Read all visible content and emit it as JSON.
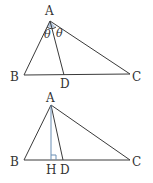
{
  "figure1": {
    "vertices": {
      "A": {
        "label": "A",
        "x": 50,
        "y": 21
      },
      "B": {
        "label": "B",
        "x": 24,
        "y": 75
      },
      "C": {
        "label": "C",
        "x": 130,
        "y": 74
      },
      "D": {
        "label": "D",
        "x": 64,
        "y": 75
      }
    },
    "angle_labels": [
      "θ",
      "θ"
    ],
    "angle_fill": "#9fb8d6"
  },
  "figure2": {
    "vertices": {
      "A": {
        "label": "A",
        "x": 51,
        "y": 105
      },
      "B": {
        "label": "B",
        "x": 24,
        "y": 160
      },
      "C": {
        "label": "C",
        "x": 130,
        "y": 160
      },
      "H": {
        "label": "H",
        "x": 51,
        "y": 160
      },
      "D": {
        "label": "D",
        "x": 63,
        "y": 160
      }
    },
    "altitude_color": "#6a8fb5"
  }
}
